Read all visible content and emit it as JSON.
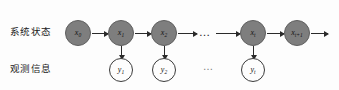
{
  "diagram": {
    "rows": {
      "state": {
        "label": "系统状态",
        "node_fill": "#7e7e7e",
        "node_stroke": "#5e5e5e"
      },
      "observation": {
        "label": "观测信息",
        "node_fill": "#fdfdfd",
        "node_stroke": "#3b3b3b"
      }
    },
    "state_nodes": [
      {
        "id": "x0",
        "base": "x",
        "sub": "0",
        "cx": 78,
        "cy": 33
      },
      {
        "id": "x1",
        "base": "x",
        "sub": "1",
        "cx": 121,
        "cy": 33
      },
      {
        "id": "x2",
        "base": "x",
        "sub": "2",
        "cx": 164,
        "cy": 33
      },
      {
        "id": "xt",
        "base": "x",
        "sub": "t",
        "cx": 253,
        "cy": 33
      },
      {
        "id": "xt1",
        "base": "x",
        "sub": "t+1",
        "cx": 297,
        "cy": 33
      }
    ],
    "observation_nodes": [
      {
        "id": "y1",
        "base": "y",
        "sub": "1",
        "cx": 121,
        "cy": 70
      },
      {
        "id": "y2",
        "base": "y",
        "sub": "2",
        "cx": 164,
        "cy": 70
      },
      {
        "id": "yt",
        "base": "y",
        "sub": "t",
        "cx": 253,
        "cy": 70
      }
    ],
    "ellipsis_state": "…",
    "ellipsis_observation": "…",
    "transition_arrows": [
      {
        "from": "x0",
        "to": "x1"
      },
      {
        "from": "x1",
        "to": "x2"
      },
      {
        "from": "x2",
        "to": "ellipsis"
      },
      {
        "from": "ellipsis",
        "to": "xt"
      },
      {
        "from": "xt",
        "to": "xt1"
      },
      {
        "from": "xt1",
        "to": "next"
      }
    ],
    "emission_arrows": [
      {
        "from": "x1",
        "to": "y1"
      },
      {
        "from": "x2",
        "to": "y2"
      },
      {
        "from": "xt",
        "to": "yt"
      }
    ]
  }
}
